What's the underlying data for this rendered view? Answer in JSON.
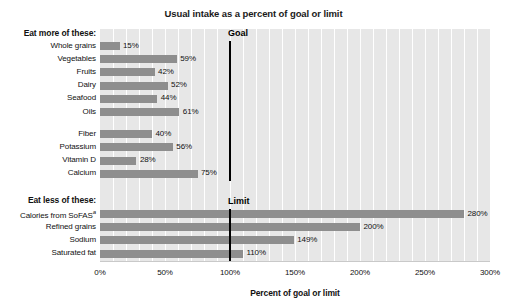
{
  "chart_data": {
    "type": "bar",
    "orientation": "horizontal",
    "title": "Usual intake as a percent of goal or limit",
    "xlabel": "Percent of goal or limit",
    "ylabel": "",
    "xlim": [
      0,
      300
    ],
    "xticks": [
      "0%",
      "50%",
      "100%",
      "150%",
      "200%",
      "250%",
      "300%"
    ],
    "xtick_values": [
      0,
      50,
      100,
      150,
      200,
      250,
      300
    ],
    "grid": true,
    "grid_axis": "x",
    "legend": "none",
    "bar_color": "#8e8e8e",
    "plot_background": "#e7e7e7",
    "gridline_color": "#ffffff",
    "reference_line_color": "#000000",
    "groups": [
      {
        "heading": "Eat more of these:",
        "reference_line": {
          "label": "Goal",
          "value": 100
        },
        "subgroups": [
          {
            "categories": [
              "Whole grains",
              "Vegetables",
              "Fruits",
              "Dairy",
              "Seafood",
              "Oils"
            ],
            "values": [
              15,
              59,
              42,
              52,
              44,
              61
            ],
            "labels": [
              "15%",
              "59%",
              "42%",
              "52%",
              "44%",
              "61%"
            ]
          },
          {
            "categories": [
              "Fiber",
              "Potassium",
              "Vitamin D",
              "Calcium"
            ],
            "values": [
              40,
              56,
              28,
              75
            ],
            "labels": [
              "40%",
              "56%",
              "28%",
              "75%"
            ]
          }
        ]
      },
      {
        "heading": "Eat less of these:",
        "reference_line": {
          "label": "Limit",
          "value": 100
        },
        "subgroups": [
          {
            "categories": [
              "Calories from SoFAS",
              "Refined grains",
              "Sodium",
              "Saturated fat"
            ],
            "category_superscripts": [
              "a",
              "",
              "",
              ""
            ],
            "values": [
              280,
              200,
              149,
              110
            ],
            "labels": [
              "280%",
              "200%",
              "149%",
              "110%"
            ]
          }
        ]
      }
    ]
  },
  "chart": {
    "title": "Usual intake as a percent of goal or limit",
    "xlabel": "Percent of goal or limit",
    "headings": {
      "eat_more": "Eat more of these:",
      "eat_less": "Eat less of these:"
    },
    "reference_labels": {
      "goal": "Goal",
      "limit": "Limit"
    },
    "ticks": [
      "0%",
      "50%",
      "100%",
      "150%",
      "200%",
      "250%",
      "300%"
    ],
    "rows": [
      {
        "label": "Whole grains",
        "sup": "",
        "value": "15%"
      },
      {
        "label": "Vegetables",
        "sup": "",
        "value": "59%"
      },
      {
        "label": "Fruits",
        "sup": "",
        "value": "42%"
      },
      {
        "label": "Dairy",
        "sup": "",
        "value": "52%"
      },
      {
        "label": "Seafood",
        "sup": "",
        "value": "44%"
      },
      {
        "label": "Oils",
        "sup": "",
        "value": "61%"
      },
      {
        "label": "Fiber",
        "sup": "",
        "value": "40%"
      },
      {
        "label": "Potassium",
        "sup": "",
        "value": "56%"
      },
      {
        "label": "Vitamin D",
        "sup": "",
        "value": "28%"
      },
      {
        "label": "Calcium",
        "sup": "",
        "value": "75%"
      },
      {
        "label": "Calories from SoFAS",
        "sup": "a",
        "value": "280%"
      },
      {
        "label": "Refined grains",
        "sup": "",
        "value": "200%"
      },
      {
        "label": "Sodium",
        "sup": "",
        "value": "149%"
      },
      {
        "label": "Saturated fat",
        "sup": "",
        "value": "110%"
      }
    ]
  }
}
